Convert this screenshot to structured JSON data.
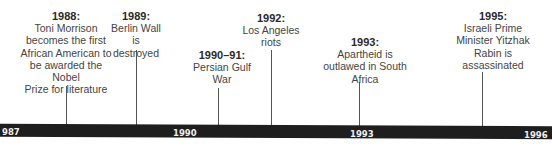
{
  "timeline": {
    "axis_labels": [
      "987",
      "1990",
      "1993",
      "1996"
    ],
    "events": [
      {
        "year": "1988:",
        "text": [
          "Toni Morrison",
          "becomes the first",
          "African American to",
          "be awarded the Nobel",
          "Prize for literature"
        ]
      },
      {
        "year": "1989:",
        "text": [
          "Berlin Wall is",
          "destroyed"
        ]
      },
      {
        "year": "1990–91:",
        "text": [
          "Persian Gulf",
          "War"
        ]
      },
      {
        "year": "1992:",
        "text": [
          "Los Angeles",
          "riots"
        ]
      },
      {
        "year": "1993:",
        "text": [
          "Apartheid is",
          "outlawed in South",
          "Africa"
        ]
      },
      {
        "year": "1995:",
        "text": [
          "Israeli Prime",
          "Minister Yitzhak",
          "Rabin is",
          "assassinated"
        ]
      }
    ]
  }
}
